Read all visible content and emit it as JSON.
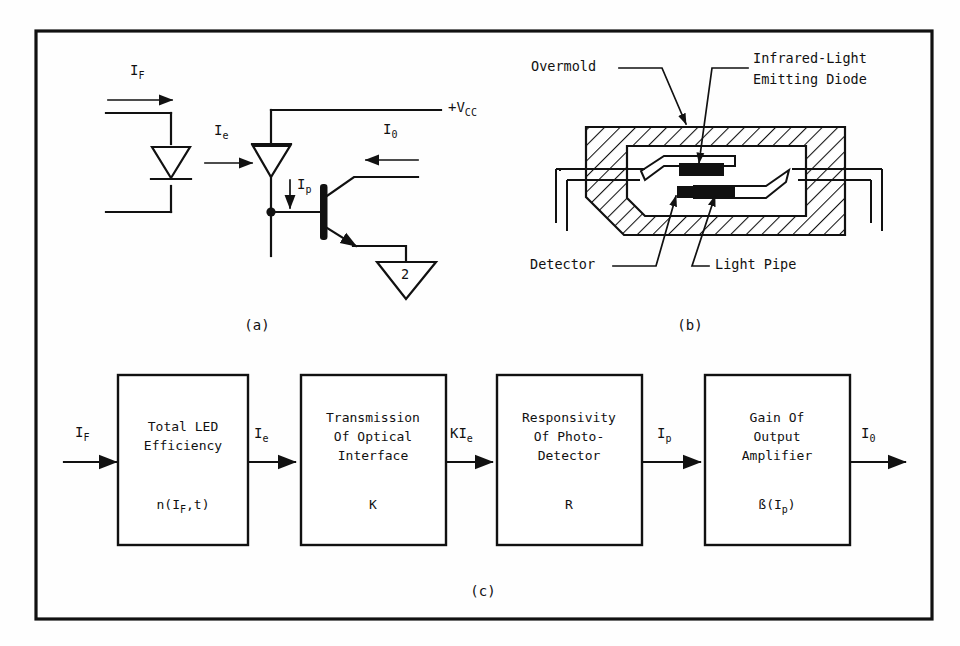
{
  "figure": {
    "background_color": "#fefefe",
    "line_color": "#111111",
    "panels": [
      {
        "id": "a",
        "caption": "(a)"
      },
      {
        "id": "b",
        "caption": "(b)"
      },
      {
        "id": "c",
        "caption": "(c)"
      }
    ]
  },
  "panel_a": {
    "caption": "(a)",
    "labels": {
      "input_current": "I",
      "input_current_sub": "F",
      "led_output_current": "I",
      "led_output_current_sub": "e",
      "photo_current": "I",
      "photo_current_sub": "p",
      "output_current": "I",
      "output_current_sub": "0",
      "supply": "+V",
      "supply_sub": "CC",
      "ground_symbol_text": "2"
    }
  },
  "panel_b": {
    "caption": "(b)",
    "labels": {
      "overmold": "Overmold",
      "led_line1": "Infrared-Light",
      "led_line2": "Emitting Diode",
      "detector": "Detector",
      "light_pipe": "Light Pipe"
    }
  },
  "panel_c": {
    "caption": "(c)",
    "input_label": "I",
    "input_label_sub": "F",
    "output_label": "I",
    "output_label_sub": "0",
    "blocks": [
      {
        "name": "total-led-efficiency",
        "line1": "Total LED",
        "line2": "Efficiency",
        "line3": "",
        "symbol": "n(I",
        "symbol_sub": "F",
        "symbol_tail": ",t)"
      },
      {
        "name": "transmission-of-optical-interface",
        "line1": "Transmission",
        "line2": "Of Optical",
        "line3": "Interface",
        "symbol": "K",
        "symbol_sub": "",
        "symbol_tail": ""
      },
      {
        "name": "responsivity-of-photo-detector",
        "line1": "Responsivity",
        "line2": "Of Photo-",
        "line3": "Detector",
        "symbol": "R",
        "symbol_sub": "",
        "symbol_tail": ""
      },
      {
        "name": "gain-of-output-amplifier",
        "line1": "Gain Of",
        "line2": "Output",
        "line3": "Amplifier",
        "symbol": "ß(I",
        "symbol_sub": "p",
        "symbol_tail": ")"
      }
    ],
    "connector_labels": [
      {
        "main": "I",
        "sub": "e"
      },
      {
        "main": "KI",
        "sub": "e"
      },
      {
        "main": "I",
        "sub": "p"
      }
    ]
  }
}
